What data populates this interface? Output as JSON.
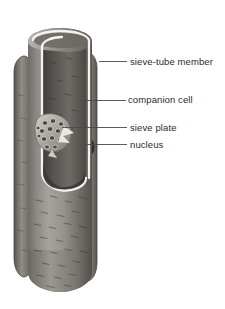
{
  "figure": {
    "background_color": "#ffffff",
    "style": "grayscale shaded botanical illustration",
    "labels": [
      {
        "id": "sieve-tube-member",
        "text": "sieve-tube member",
        "leader": {
          "x1": 99,
          "y1": 61,
          "x2": 127,
          "y2": 61
        },
        "points_to": "interior wall of the large cut-open cylindrical cell"
      },
      {
        "id": "companion-cell",
        "text": "companion cell",
        "leader": {
          "x1": 82,
          "y1": 100,
          "x2": 126,
          "y2": 100
        },
        "points_to": "narrow elongated cell attached at right of sieve tube"
      },
      {
        "id": "sieve-plate",
        "text": "sieve plate",
        "leader": {
          "x1": 62,
          "y1": 127,
          "x2": 127,
          "y2": 127
        },
        "points_to": "perforated end wall disc inside the tube"
      },
      {
        "id": "nucleus",
        "text": "nucleus",
        "leader": {
          "x1": 86,
          "y1": 144,
          "x2": 127,
          "y2": 144
        },
        "points_to": "dark rounded body within the companion cell"
      }
    ],
    "structures": [
      {
        "name": "sieve-tube-member",
        "description": "large vertical cylinder, cut away at upper left to reveal lumen"
      },
      {
        "name": "companion-cell-right",
        "description": "slender rounded cell along right side of the sieve tube"
      },
      {
        "name": "companion-cell-left",
        "description": "slender rounded cell along left side of the sieve tube"
      },
      {
        "name": "sieve-plate",
        "description": "oblique oval plate pierced by about fourteen round pores"
      },
      {
        "name": "nucleus",
        "description": "dark ovoid organelle in the right companion cell"
      },
      {
        "name": "cut-edge-highlight",
        "description": "pale outline tracing the cut margin of the cell wall"
      }
    ],
    "colors": {
      "background": "#ffffff",
      "cell_wall_light": "#c9c7c2",
      "cell_wall_mid": "#8e8b86",
      "cell_wall_dark": "#5d5a56",
      "lumen_dark": "#4a4744",
      "cut_highlight": "#f2f1ee",
      "leader_line": "#4a4a4a",
      "label_text": "#2b2b2b",
      "texture_stroke": "#3a3835"
    }
  }
}
